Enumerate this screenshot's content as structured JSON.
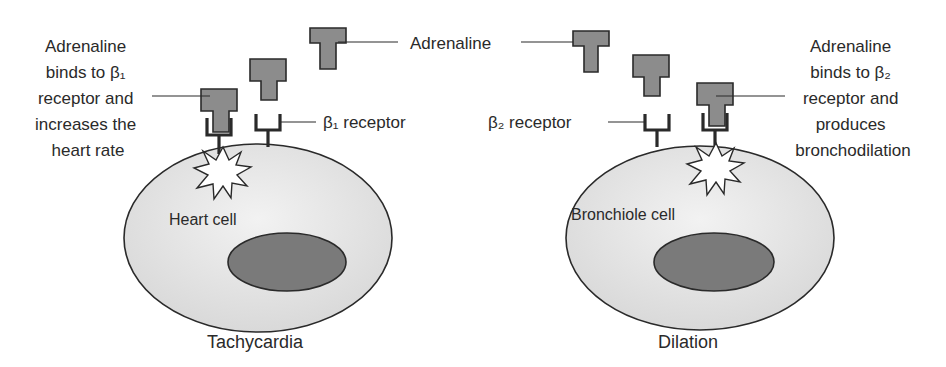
{
  "diagram": {
    "top_label": "Adrenaline",
    "left": {
      "callout_lines": [
        "Adrenaline",
        "binds to β₁",
        "receptor and",
        "increases the",
        "heart rate"
      ],
      "receptor_label": "β₁ receptor",
      "cell_label": "Heart cell",
      "caption": "Tachycardia"
    },
    "right": {
      "callout_lines": [
        "Adrenaline",
        "binds to β₂",
        "receptor and",
        "produces",
        "bronchodilation"
      ],
      "receptor_label": "β₂ receptor",
      "cell_label": "Bronchiole cell",
      "caption": "Dilation"
    },
    "colors": {
      "ligand_fill": "#8c8c8c",
      "cell_fill": "#e6e6e6",
      "nucleus_fill": "#7a7a7a",
      "stroke": "#2a2a2a"
    }
  }
}
